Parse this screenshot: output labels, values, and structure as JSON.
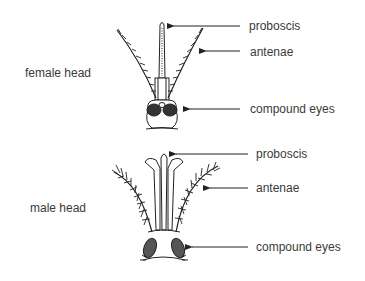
{
  "female": {
    "title": "female head",
    "labels": {
      "proboscis": "proboscis",
      "antenae": "antenae",
      "compound_eyes": "compound eyes"
    }
  },
  "male": {
    "title": "male head",
    "labels": {
      "proboscis": "proboscis",
      "antenae": "antenae",
      "compound_eyes": "compound eyes"
    }
  },
  "colors": {
    "ink": "#222222",
    "text": "#3a3a3a",
    "background": "#ffffff"
  }
}
